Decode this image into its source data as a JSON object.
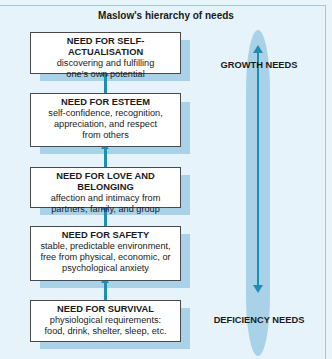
{
  "title": "Maslow's hierarchy of needs",
  "levels": [
    {
      "heading": "NEED FOR SELF-ACTUALISATION",
      "lines": [
        "discovering and fulfilling",
        "one's own potential"
      ]
    },
    {
      "heading": "NEED FOR ESTEEM",
      "lines": [
        "self-confidence, recognition,",
        "appreciation, and respect",
        "from others"
      ]
    },
    {
      "heading": "NEED FOR LOVE AND BELONGING",
      "lines": [
        "affection and intimacy from",
        "partners, family, and group"
      ]
    },
    {
      "heading": "NEED FOR SAFETY",
      "lines": [
        "stable, predictable environment,",
        "free from physical, economic, or",
        "psychological anxiety"
      ]
    },
    {
      "heading": "NEED FOR SURVIVAL",
      "lines": [
        "physiological requirements:",
        "food, drink, shelter, sleep, etc."
      ]
    }
  ],
  "axis": {
    "top_label": "GROWTH NEEDS",
    "bottom_label": "DEFICIENCY NEEDS"
  },
  "colors": {
    "accent": "#1e8fb0",
    "band": "#a9d2e8",
    "background": "#e6f3fa"
  }
}
